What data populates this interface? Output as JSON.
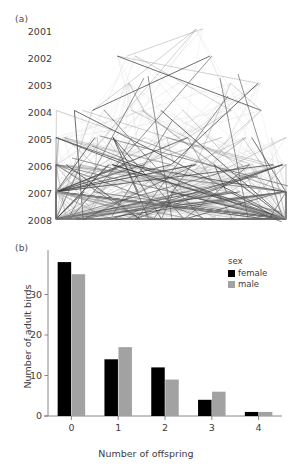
{
  "figure": {
    "panels": [
      {
        "tag": "(a)"
      },
      {
        "tag": "(b)"
      }
    ]
  },
  "panel_a": {
    "tag": "(a)",
    "type": "pedigree-network",
    "axis_title": "",
    "year_ticks": [
      "2001",
      "2002",
      "2003",
      "2004",
      "2005",
      "2006",
      "2007",
      "2008"
    ]
  },
  "panel_b": {
    "tag": "(b)",
    "legend": {
      "title": "sex",
      "entries": [
        {
          "label": "female",
          "color": "#000000"
        },
        {
          "label": "male",
          "color": "#a2a2a2"
        }
      ]
    }
  },
  "chart_data": [
    {
      "type": "line",
      "title": "(a)",
      "xlabel": "",
      "ylabel": "",
      "ytick_labels": [
        "2001",
        "2002",
        "2003",
        "2004",
        "2005",
        "2006",
        "2007",
        "2008"
      ],
      "ylim": [
        2001,
        2008
      ],
      "grid": false,
      "legend_position": "none",
      "note": "Pedigree / parent-offspring link diagram: many thin grey line segments connecting individuals between breeding years 2001-2008, increasing in density toward 2008."
    },
    {
      "type": "bar",
      "title": "(b)",
      "categories": [
        "0",
        "1",
        "2",
        "3",
        "4"
      ],
      "series": [
        {
          "name": "female",
          "color": "#000000",
          "values": [
            38,
            14,
            12,
            4,
            1
          ]
        },
        {
          "name": "male",
          "color": "#a2a2a2",
          "values": [
            35,
            17,
            9,
            6,
            1
          ]
        }
      ],
      "xlabel": "Number of offspring",
      "ylabel": "Number of adult birds",
      "xtick_labels": [
        "0",
        "1",
        "2",
        "3",
        "4"
      ],
      "ytick_labels": [
        "0",
        "10",
        "20",
        "30"
      ],
      "ytick_values": [
        0,
        10,
        20,
        30
      ],
      "ylim": [
        0,
        40
      ],
      "grid": false,
      "legend_title": "sex",
      "legend_position": "top-right"
    }
  ]
}
